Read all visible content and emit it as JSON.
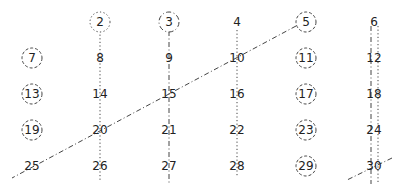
{
  "diagram": {
    "title": "",
    "type": "sieve-of-eratosthenes",
    "columns": 6,
    "rows": 5,
    "numbers": [
      {
        "value": "2",
        "col": 1,
        "row": 0,
        "circle": "dotted"
      },
      {
        "value": "3",
        "col": 2,
        "row": 0,
        "circle": "dashdot"
      },
      {
        "value": "4",
        "col": 3,
        "row": 0,
        "circle": "none"
      },
      {
        "value": "5",
        "col": 4,
        "row": 0,
        "circle": "dashed"
      },
      {
        "value": "6",
        "col": 5,
        "row": 0,
        "circle": "none"
      },
      {
        "value": "7",
        "col": 0,
        "row": 1,
        "circle": "dashed"
      },
      {
        "value": "8",
        "col": 1,
        "row": 1,
        "circle": "none"
      },
      {
        "value": "9",
        "col": 2,
        "row": 1,
        "circle": "none"
      },
      {
        "value": "10",
        "col": 3,
        "row": 1,
        "circle": "none"
      },
      {
        "value": "11",
        "col": 4,
        "row": 1,
        "circle": "dashed"
      },
      {
        "value": "12",
        "col": 5,
        "row": 1,
        "circle": "none"
      },
      {
        "value": "13",
        "col": 0,
        "row": 2,
        "circle": "dashed"
      },
      {
        "value": "14",
        "col": 1,
        "row": 2,
        "circle": "none"
      },
      {
        "value": "15",
        "col": 2,
        "row": 2,
        "circle": "none"
      },
      {
        "value": "16",
        "col": 3,
        "row": 2,
        "circle": "none"
      },
      {
        "value": "17",
        "col": 4,
        "row": 2,
        "circle": "dashed"
      },
      {
        "value": "18",
        "col": 5,
        "row": 2,
        "circle": "none"
      },
      {
        "value": "19",
        "col": 0,
        "row": 3,
        "circle": "dashed"
      },
      {
        "value": "20",
        "col": 1,
        "row": 3,
        "circle": "none"
      },
      {
        "value": "21",
        "col": 2,
        "row": 3,
        "circle": "none"
      },
      {
        "value": "22",
        "col": 3,
        "row": 3,
        "circle": "none"
      },
      {
        "value": "23",
        "col": 4,
        "row": 3,
        "circle": "dashed"
      },
      {
        "value": "24",
        "col": 5,
        "row": 3,
        "circle": "none"
      },
      {
        "value": "25",
        "col": 0,
        "row": 4,
        "circle": "none"
      },
      {
        "value": "26",
        "col": 1,
        "row": 4,
        "circle": "none"
      },
      {
        "value": "27",
        "col": 2,
        "row": 4,
        "circle": "none"
      },
      {
        "value": "28",
        "col": 3,
        "row": 4,
        "circle": "none"
      },
      {
        "value": "29",
        "col": 4,
        "row": 4,
        "circle": "dashed"
      },
      {
        "value": "30",
        "col": 5,
        "row": 4,
        "circle": "none"
      }
    ],
    "strike_lines": [
      {
        "name": "multiples-of-2-col2",
        "style": "dotted",
        "x1": 100,
        "y1": 31,
        "x2": 100,
        "y2": 182
      },
      {
        "name": "multiples-of-2-col4",
        "style": "dotted",
        "x1": 237,
        "y1": 30,
        "x2": 237,
        "y2": 176
      },
      {
        "name": "multiples-of-2-col6",
        "style": "dotted",
        "x1": 378,
        "y1": 26,
        "x2": 378,
        "y2": 182
      },
      {
        "name": "multiples-of-3-col3",
        "style": "dashdot",
        "x1": 169,
        "y1": 31,
        "x2": 169,
        "y2": 184
      },
      {
        "name": "multiples-of-3-col6",
        "style": "dashdot",
        "x1": 371,
        "y1": 26,
        "x2": 371,
        "y2": 184
      },
      {
        "name": "multiples-of-5-diagonal",
        "style": "dashdot",
        "x1": 296,
        "y1": 26,
        "x2": 12,
        "y2": 178
      },
      {
        "name": "multiples-of-5-30",
        "style": "dashdot",
        "x1": 392,
        "y1": 158,
        "x2": 347,
        "y2": 180
      }
    ],
    "grid": {
      "col_x": [
        32,
        100,
        169,
        237,
        306,
        374
      ],
      "row_y": [
        22,
        58,
        94,
        130,
        166
      ]
    },
    "colors": {
      "ink": "#222222",
      "line": "#444444"
    }
  }
}
